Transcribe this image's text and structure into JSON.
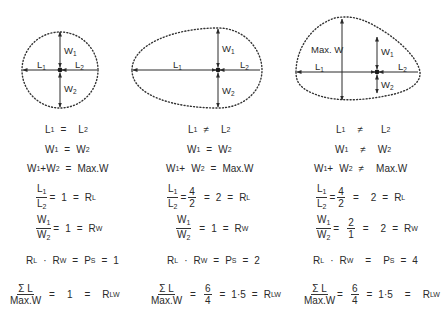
{
  "diagram": {
    "shapes": [
      {
        "id": "circle",
        "labels": {
          "l1": "L",
          "l2": "L",
          "w1": "W",
          "w2": "W",
          "sub1": "1",
          "sub2": "2"
        },
        "equations": {
          "e1": {
            "left": "L",
            "ls": "1",
            "op": "=",
            "right": "L",
            "rs": "2"
          },
          "e2": {
            "left": "W",
            "ls": "1",
            "op": "=",
            "right": "W",
            "rs": "2"
          },
          "e3": {
            "a": "W",
            "as": "1",
            "plus": "+",
            "b": "W",
            "bs": "2",
            "op": "=",
            "right": "Max.W"
          },
          "e4": {
            "num": "L",
            "ns": "1",
            "den": "L",
            "ds": "2",
            "eq1": "=",
            "val": "1",
            "eq2": "=",
            "res": "R",
            "rs": "L"
          },
          "e5": {
            "num": "W",
            "ns": "1",
            "den": "W",
            "ds": "2",
            "eq1": "=",
            "val": "1",
            "eq2": "=",
            "res": "R",
            "rs": "W"
          },
          "e6": {
            "a": "R",
            "as": "L",
            "dot": "·",
            "b": "R",
            "bs": "W",
            "eq1": "=",
            "p": "P",
            "ps": "S",
            "eq2": "=",
            "val": "1"
          },
          "e7": {
            "num": "Σ L",
            "den": "Max.W",
            "eq1": "=",
            "val": "1",
            "eq2": "=",
            "res": "R",
            "rs": "LW"
          }
        }
      },
      {
        "id": "egg",
        "labels": {
          "l1": "L",
          "l2": "L",
          "w1": "W",
          "w2": "W",
          "sub1": "1",
          "sub2": "2"
        },
        "equations": {
          "e1": {
            "left": "L",
            "ls": "1",
            "op": "≠",
            "right": "L",
            "rs": "2"
          },
          "e2": {
            "left": "W",
            "ls": "1",
            "op": "=",
            "right": "W",
            "rs": "2"
          },
          "e3": {
            "a": "W",
            "as": "1",
            "plus": "+",
            "b": "W",
            "bs": "2",
            "op": "=",
            "right": "Max.W"
          },
          "e4": {
            "num": "L",
            "ns": "1",
            "den": "L",
            "ds": "2",
            "eq0": "=",
            "fnum": "4",
            "fden": "2",
            "eq1": "=",
            "val": "2",
            "eq2": "=",
            "res": "R",
            "rs": "L"
          },
          "e5": {
            "num": "W",
            "ns": "1",
            "den": "W",
            "ds": "2",
            "eq1": "=",
            "val": "1",
            "eq2": "=",
            "res": "R",
            "rs": "W"
          },
          "e6": {
            "a": "R",
            "as": "L",
            "dot": "·",
            "b": "R",
            "bs": "W",
            "eq1": "=",
            "p": "P",
            "ps": "S",
            "eq2": "=",
            "val": "2"
          },
          "e7": {
            "num": "Σ L",
            "den": "Max.W",
            "eq0": "=",
            "fnum": "6",
            "fden": "4",
            "eq1": "=",
            "val": "1·5",
            "eq2": "=",
            "res": "R",
            "rs": "LW"
          }
        }
      },
      {
        "id": "irregular",
        "labels": {
          "l1": "L",
          "l2": "L",
          "w1": "W",
          "w2": "W",
          "sub1": "1",
          "sub2": "2",
          "maxw": "Max. W"
        },
        "equations": {
          "e1": {
            "left": "L",
            "ls": "1",
            "op": "≠",
            "right": "L",
            "rs": "2"
          },
          "e2": {
            "left": "W",
            "ls": "1",
            "op": "≠",
            "right": "W",
            "rs": "2"
          },
          "e3": {
            "a": "W",
            "as": "1",
            "plus": "+",
            "b": "W",
            "bs": "2",
            "op": "≠",
            "right": "Max.W"
          },
          "e4": {
            "num": "L",
            "ns": "1",
            "den": "L",
            "ds": "2",
            "eq0": "=",
            "fnum": "4",
            "fden": "2",
            "eq1": "=",
            "val": "2",
            "eq2": "=",
            "res": "R",
            "rs": "L"
          },
          "e5": {
            "num": "W",
            "ns": "1",
            "den": "W",
            "ds": "2",
            "eq0": "=",
            "fnum": "2",
            "fden": "1",
            "eq1": "=",
            "val": "2",
            "eq2": "=",
            "res": "R",
            "rs": "W"
          },
          "e6": {
            "a": "R",
            "as": "L",
            "dot": "·",
            "b": "R",
            "bs": "W",
            "eq1": "=",
            "p": "P",
            "ps": "S",
            "eq2": "=",
            "val": "4"
          },
          "e7": {
            "num": "Σ L",
            "den": "Max.W",
            "eq0": "=",
            "fnum": "6",
            "fden": "4",
            "eq1": "=",
            "val": "1·5",
            "eq2": "=",
            "res": "R",
            "rs": "LW"
          }
        }
      }
    ]
  }
}
